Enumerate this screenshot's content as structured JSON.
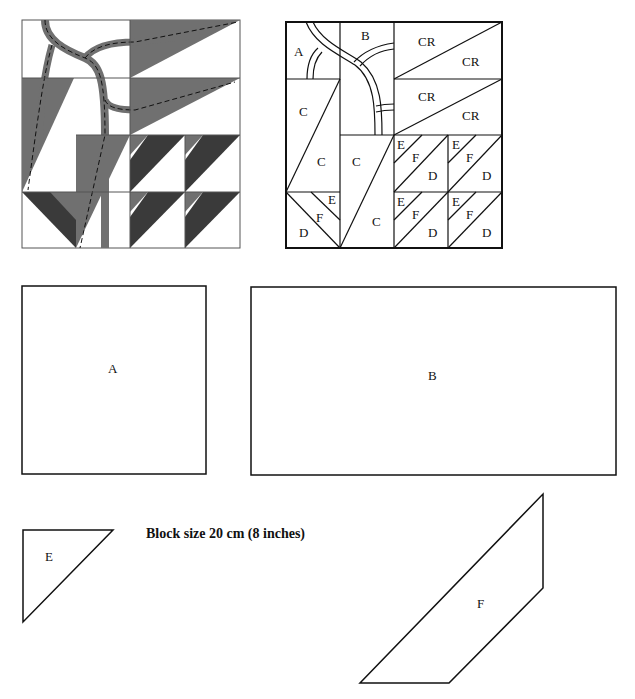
{
  "title": "Block size 20 cm (8 inches)",
  "colors": {
    "mid_gray": "#6e6e6e",
    "dark_gray": "#3a3a3a",
    "line": "#111111",
    "background": "#ffffff"
  },
  "block_diagram": {
    "labels": [
      "A",
      "B",
      "CR",
      "CR",
      "CR",
      "CR",
      "C",
      "C",
      "C",
      "C",
      "E",
      "F",
      "D",
      "E",
      "F",
      "D",
      "E",
      "F",
      "D",
      "E",
      "F",
      "D",
      "E",
      "F",
      "D"
    ]
  },
  "templates": {
    "A": "A",
    "B": "B",
    "E": "E",
    "F": "F"
  }
}
